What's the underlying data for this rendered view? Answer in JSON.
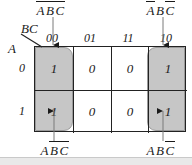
{
  "diagram": {
    "type": "karnaugh-map",
    "title": "",
    "axis": {
      "columns_label": "BC",
      "rows_label": "A"
    },
    "column_headers": [
      "00",
      "01",
      "11",
      "10"
    ],
    "row_headers": [
      "0",
      "1"
    ],
    "cells": [
      [
        {
          "value": "1",
          "shaded": true,
          "covered_by_arrow": false
        },
        {
          "value": "0",
          "shaded": false,
          "covered_by_arrow": false
        },
        {
          "value": "0",
          "shaded": false,
          "covered_by_arrow": false
        },
        {
          "value": "1",
          "shaded": true,
          "covered_by_arrow": false
        }
      ],
      [
        {
          "value": "1",
          "shaded": true,
          "covered_by_arrow": true
        },
        {
          "value": "0",
          "shaded": false,
          "covered_by_arrow": false
        },
        {
          "value": "0",
          "shaded": false,
          "covered_by_arrow": false
        },
        {
          "value": "1",
          "shaded": true,
          "covered_by_arrow": true
        }
      ]
    ],
    "terms": {
      "top_left": {
        "plain": "ABC",
        "letters": [
          {
            "ch": "A",
            "bar": true
          },
          {
            "ch": "B",
            "bar": true
          },
          {
            "ch": "C",
            "bar": true
          }
        ]
      },
      "top_right": {
        "plain": "ABC",
        "letters": [
          {
            "ch": "A",
            "bar": true
          },
          {
            "ch": "B",
            "bar": false
          },
          {
            "ch": "C",
            "bar": true
          }
        ]
      },
      "bottom_left": {
        "plain": "ABC",
        "letters": [
          {
            "ch": "A",
            "bar": false
          },
          {
            "ch": "B",
            "bar": true
          },
          {
            "ch": "C",
            "bar": true
          }
        ]
      },
      "bottom_right": {
        "plain": "ABC",
        "letters": [
          {
            "ch": "A",
            "bar": false
          },
          {
            "ch": "B",
            "bar": false
          },
          {
            "ch": "C",
            "bar": true
          }
        ]
      }
    },
    "groups": [
      {
        "name": "left-group",
        "columns": [
          "00"
        ],
        "rows": [
          "0",
          "1"
        ],
        "color": "#c6c6c6"
      },
      {
        "name": "right-group",
        "columns": [
          "10"
        ],
        "rows": [
          "0",
          "1"
        ],
        "color": "#c6c6c6"
      }
    ],
    "colors": {
      "shade": "#c6c6c6",
      "grid_line": "#222222",
      "text": "#1a1a1a",
      "background": "#ffffff",
      "footer_band": "#e9e9e9"
    }
  }
}
